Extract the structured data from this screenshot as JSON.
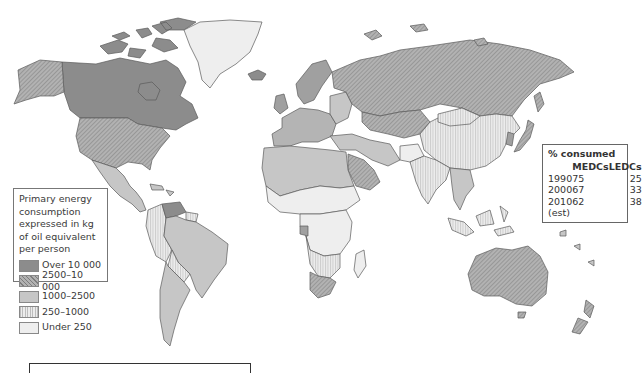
{
  "legend": {
    "title_lines": [
      "Primary energy",
      "consumption",
      "expressed in kg",
      "of oil equivalent",
      "per person"
    ],
    "items": [
      {
        "label": "Over 10 000",
        "fill": "#8c8c8c",
        "pattern": "solid"
      },
      {
        "label": "2500–10 000",
        "fill": "#a7a7a7",
        "pattern": "diagonal-hatch"
      },
      {
        "label": "1000–2500",
        "fill": "#c6c6c6",
        "pattern": "solid"
      },
      {
        "label": "250–1000",
        "fill": "#e2e2e2",
        "pattern": "vertical-lines"
      },
      {
        "label": "Under 250",
        "fill": "#eeeeee",
        "pattern": "solid"
      }
    ]
  },
  "stats": {
    "title": "% consumed",
    "columns": [
      "",
      "MEDCs",
      "LEDCs"
    ],
    "rows": [
      {
        "year": "1990",
        "medcs": "75",
        "ledcs": "25"
      },
      {
        "year": "2000",
        "medcs": "67",
        "ledcs": "33"
      },
      {
        "year": "2010",
        "medcs": "62",
        "ledcs": "38"
      }
    ],
    "note": "(est)"
  },
  "map": {
    "regions": [
      {
        "name": "Canada",
        "class": "Over 10 000"
      },
      {
        "name": "USA",
        "class": "2500–10 000"
      },
      {
        "name": "Alaska",
        "class": "2500–10 000"
      },
      {
        "name": "Greenland",
        "class": "Under 250"
      },
      {
        "name": "Russia",
        "class": "2500–10 000"
      },
      {
        "name": "Australia",
        "class": "2500–10 000"
      },
      {
        "name": "South Africa",
        "class": "2500–10 000"
      },
      {
        "name": "Brazil",
        "class": "1000–2500"
      },
      {
        "name": "Argentina",
        "class": "1000–2500"
      },
      {
        "name": "China",
        "class": "250–1000"
      },
      {
        "name": "India",
        "class": "250–1000"
      },
      {
        "name": "Central Africa",
        "class": "Under 250"
      },
      {
        "name": "Europe",
        "class": "1000–2500"
      },
      {
        "name": "Middle East",
        "class": "2500–10 000"
      }
    ]
  },
  "colors": {
    "border": "#5a5a5a",
    "ocean": "#ffffff"
  }
}
